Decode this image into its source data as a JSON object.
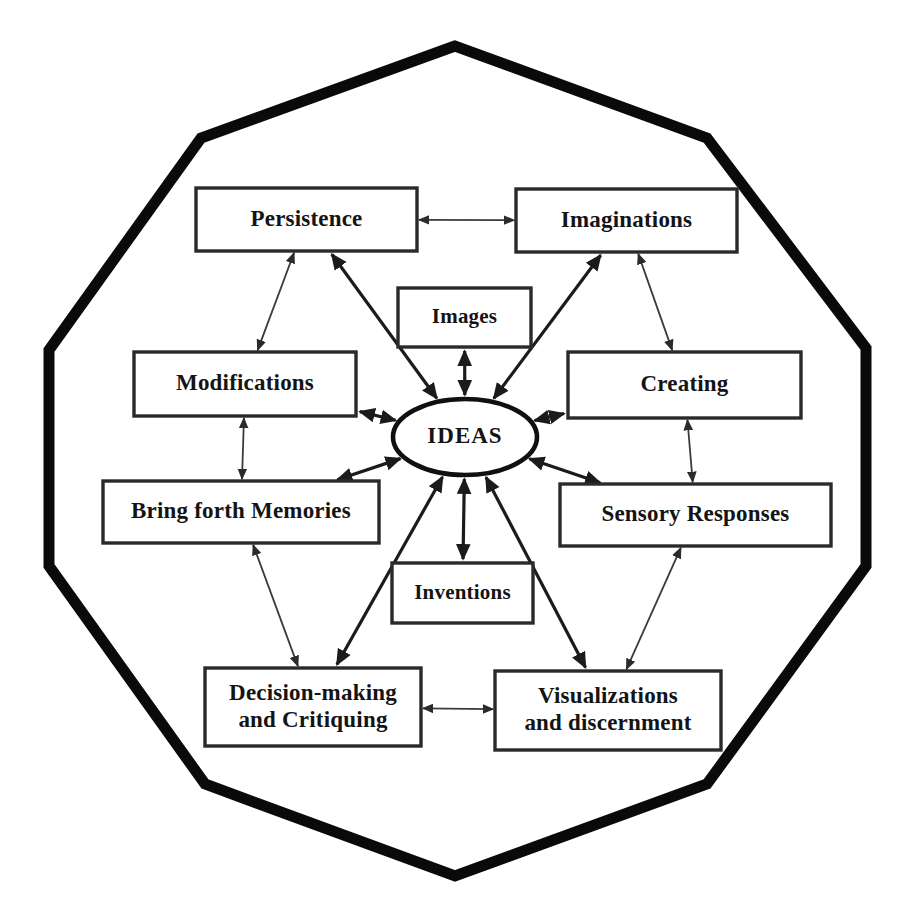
{
  "diagram": {
    "title": "IDEAS",
    "type": "concept-map",
    "shape": "decagon",
    "center": {
      "label": "IDEAS",
      "shape": "ellipse",
      "cx": 465,
      "cy": 437,
      "rx": 72,
      "ry": 38
    },
    "colors": {
      "background": "#ffffff",
      "outline": "#0a0a0a",
      "box_stroke": "#2a2a2a",
      "text": "#141414",
      "spoke": "#1b1b1b",
      "ring_link": "#3a3a3a"
    },
    "outer_polygon_points": "455,46 201,138 49,350 49,566 205,784 455,876 707,784 866,566 866,348 707,138",
    "nodes": [
      {
        "id": "persistence",
        "label": "Persistence",
        "lines": [
          "Persistence"
        ],
        "x": 196,
        "y": 188,
        "w": 221,
        "h": 63
      },
      {
        "id": "imaginations",
        "label": "Imaginations",
        "lines": [
          "Imaginations"
        ],
        "x": 516,
        "y": 189,
        "w": 221,
        "h": 63
      },
      {
        "id": "images",
        "label": "Images",
        "lines": [
          "Images"
        ],
        "x": 398,
        "y": 288,
        "w": 133,
        "h": 59
      },
      {
        "id": "modifications",
        "label": "Modifications",
        "lines": [
          "Modifications"
        ],
        "x": 134,
        "y": 352,
        "w": 222,
        "h": 64
      },
      {
        "id": "creating",
        "label": "Creating",
        "lines": [
          "Creating"
        ],
        "x": 568,
        "y": 352,
        "w": 233,
        "h": 66
      },
      {
        "id": "memories",
        "label": "Bring forth Memories",
        "lines": [
          "Bring forth Memories"
        ],
        "x": 103,
        "y": 481,
        "w": 276,
        "h": 62
      },
      {
        "id": "sensory",
        "label": "Sensory Responses",
        "lines": [
          "Sensory Responses"
        ],
        "x": 560,
        "y": 484,
        "w": 271,
        "h": 62
      },
      {
        "id": "inventions",
        "label": "Inventions",
        "lines": [
          "Inventions"
        ],
        "x": 392,
        "y": 563,
        "w": 141,
        "h": 60
      },
      {
        "id": "decision",
        "label": "Decision-making and Critiquing",
        "lines": [
          "Decision-making",
          "and Critiquing"
        ],
        "x": 205,
        "y": 668,
        "w": 216,
        "h": 78
      },
      {
        "id": "visualizations",
        "label": "Visualizations and discernment",
        "lines": [
          "Visualizations",
          "and discernment"
        ],
        "x": 495,
        "y": 671,
        "w": 226,
        "h": 79
      }
    ],
    "spokes": [
      {
        "from": "persistence",
        "to": "center",
        "bidirectional": true
      },
      {
        "from": "imaginations",
        "to": "center",
        "bidirectional": true
      },
      {
        "from": "images",
        "to": "center",
        "bidirectional": true
      },
      {
        "from": "modifications",
        "to": "center",
        "bidirectional": true
      },
      {
        "from": "creating",
        "to": "center",
        "bidirectional": true
      },
      {
        "from": "memories",
        "to": "center",
        "bidirectional": true
      },
      {
        "from": "sensory",
        "to": "center",
        "bidirectional": true
      },
      {
        "from": "inventions",
        "to": "center",
        "bidirectional": true
      },
      {
        "from": "decision",
        "to": "center",
        "bidirectional": true
      },
      {
        "from": "visualizations",
        "to": "center",
        "bidirectional": true
      }
    ],
    "ring_links": [
      {
        "from": "persistence",
        "to": "imaginations",
        "bidirectional": true
      },
      {
        "from": "imaginations",
        "to": "creating",
        "bidirectional": true
      },
      {
        "from": "creating",
        "to": "sensory",
        "bidirectional": true
      },
      {
        "from": "sensory",
        "to": "visualizations",
        "bidirectional": true
      },
      {
        "from": "visualizations",
        "to": "decision",
        "bidirectional": true
      },
      {
        "from": "decision",
        "to": "memories",
        "bidirectional": true
      },
      {
        "from": "memories",
        "to": "modifications",
        "bidirectional": true
      },
      {
        "from": "modifications",
        "to": "persistence",
        "bidirectional": true
      }
    ]
  }
}
